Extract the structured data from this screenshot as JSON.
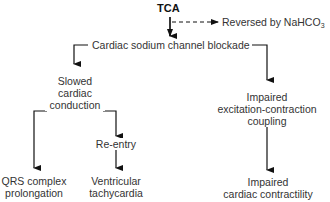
{
  "diagram": {
    "nodes": {
      "tca": "TCA",
      "reversal": "Reversed by NaHCO",
      "reversal_sub": "3",
      "blockade": "Cardiac sodium channel blockade",
      "slowed": [
        "Slowed",
        "cardiac",
        "conduction"
      ],
      "impaired_ec": [
        "Impaired",
        "excitation-contraction",
        "coupling"
      ],
      "reentry": "Re-entry",
      "qrs": [
        "QRS complex",
        "prolongation"
      ],
      "vt": [
        "Ventricular",
        "tachycardia"
      ],
      "contractility": [
        "Impaired",
        "cardiac contractility"
      ]
    },
    "edges": [
      {
        "from": "TCA",
        "to": "Cardiac sodium channel blockade",
        "style": "solid"
      },
      {
        "from": "TCA",
        "to": "Reversed by NaHCO3",
        "style": "dashed"
      },
      {
        "from": "Cardiac sodium channel blockade",
        "to": "Slowed cardiac conduction",
        "style": "solid"
      },
      {
        "from": "Cardiac sodium channel blockade",
        "to": "Impaired excitation-contraction coupling",
        "style": "solid"
      },
      {
        "from": "Slowed cardiac conduction",
        "to": "QRS complex prolongation",
        "style": "solid"
      },
      {
        "from": "Slowed cardiac conduction",
        "to": "Re-entry",
        "style": "solid"
      },
      {
        "from": "Re-entry",
        "to": "Ventricular tachycardia",
        "style": "solid"
      },
      {
        "from": "Impaired excitation-contraction coupling",
        "to": "Impaired cardiac contractility",
        "style": "solid"
      }
    ],
    "colors": {
      "line": "#111111",
      "text": "#333333",
      "background": "#ffffff"
    }
  }
}
